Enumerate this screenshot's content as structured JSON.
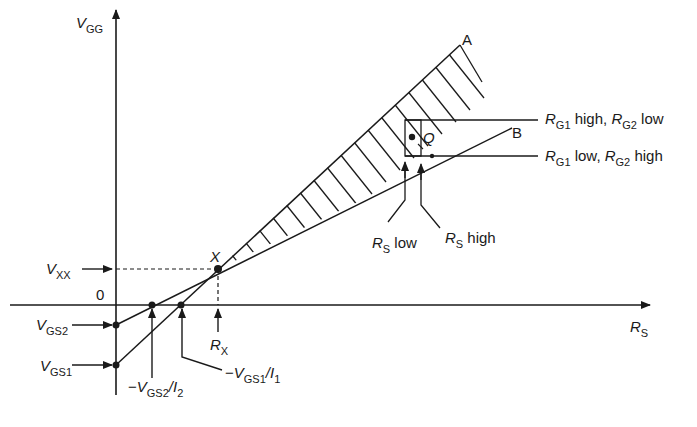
{
  "diagram": {
    "axes": {
      "y_axis": {
        "symbol": "V",
        "subscript": "GG"
      },
      "x_axis": {
        "symbol": "R",
        "subscript": "S"
      },
      "origin": "0"
    },
    "points": {
      "A": "A",
      "B": "B",
      "X": "X",
      "Q": "Q"
    },
    "left_labels": {
      "vxx": {
        "symbol": "V",
        "subscript": "XX"
      },
      "vgs2": {
        "symbol": "V",
        "subscript": "GS2"
      },
      "vgs1": {
        "symbol": "V",
        "subscript": "GS1"
      }
    },
    "bottom_labels": {
      "intercept2": {
        "prefix": "−",
        "symbol": "V",
        "subscript": "GS2",
        "slash": "/",
        "i_symbol": "I",
        "i_subscript": "2"
      },
      "intercept1": {
        "prefix": "−",
        "symbol": "V",
        "subscript": "GS1",
        "slash": "/",
        "i_symbol": "I",
        "i_subscript": "1"
      },
      "rx": {
        "symbol": "R",
        "subscript": "X"
      }
    },
    "right_labels": {
      "line_a": {
        "r1": "R",
        "s1": "G1",
        "t1": " high, ",
        "r2": "R",
        "s2": "G2",
        "t2": " low"
      },
      "line_b": {
        "r1": "R",
        "s1": "G1",
        "t1": " low, ",
        "r2": "R",
        "s2": "G2",
        "t2": " high"
      }
    },
    "rs_labels": {
      "low": {
        "symbol": "R",
        "subscript": "S",
        "text": " low"
      },
      "high": {
        "symbol": "R",
        "subscript": "S",
        "text": " high"
      }
    }
  }
}
